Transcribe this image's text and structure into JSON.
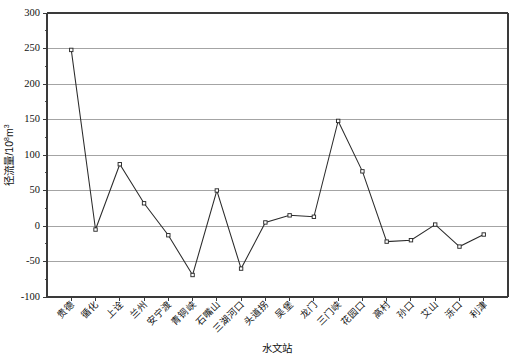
{
  "chart_data": {
    "type": "line",
    "title": "",
    "xlabel": "水文站",
    "ylabel": "径流量/10⁸m³",
    "ylabel_base": "径流量/10",
    "ylabel_exponent": "8",
    "ylabel_unit": "m",
    "ylabel_unit_exponent": "3",
    "ylim": [
      -100,
      300
    ],
    "xlim": [
      0,
      19
    ],
    "ytick_values": [
      -100,
      -50,
      0,
      50,
      100,
      150,
      200,
      250,
      300
    ],
    "ytick_labels": [
      "-100",
      "-50",
      "0",
      "50",
      "100",
      "150",
      "200",
      "250",
      "300"
    ],
    "yminor_step": 25,
    "grid": "horizontal",
    "legend": "none",
    "marker": "open-square",
    "categories": [
      "贵德",
      "循化",
      "上诠",
      "兰州",
      "安宁渡",
      "青铜峡",
      "石嘴山",
      "三湖河口",
      "头道拐",
      "吴堡",
      "龙门",
      "三门峡",
      "花园口",
      "高村",
      "孙口",
      "艾山",
      "泺口",
      "利津"
    ],
    "values": [
      248,
      -5,
      87,
      32,
      -13,
      -69,
      50,
      -60,
      5,
      15,
      13,
      148,
      77,
      -22,
      -20,
      2,
      -29,
      -12
    ],
    "series": [
      {
        "name": "径流量",
        "values": [
          248,
          -5,
          87,
          32,
          -13,
          -69,
          50,
          -60,
          5,
          15,
          13,
          148,
          77,
          -22,
          -20,
          2,
          -29,
          -12
        ]
      }
    ]
  },
  "figure": {
    "background_color": "#ffffff",
    "line_color": "#2b2b2b",
    "grid_color": "#9a9a9a",
    "axis_color": "#3a3a3a",
    "marker_face_color": "#ffffff"
  }
}
